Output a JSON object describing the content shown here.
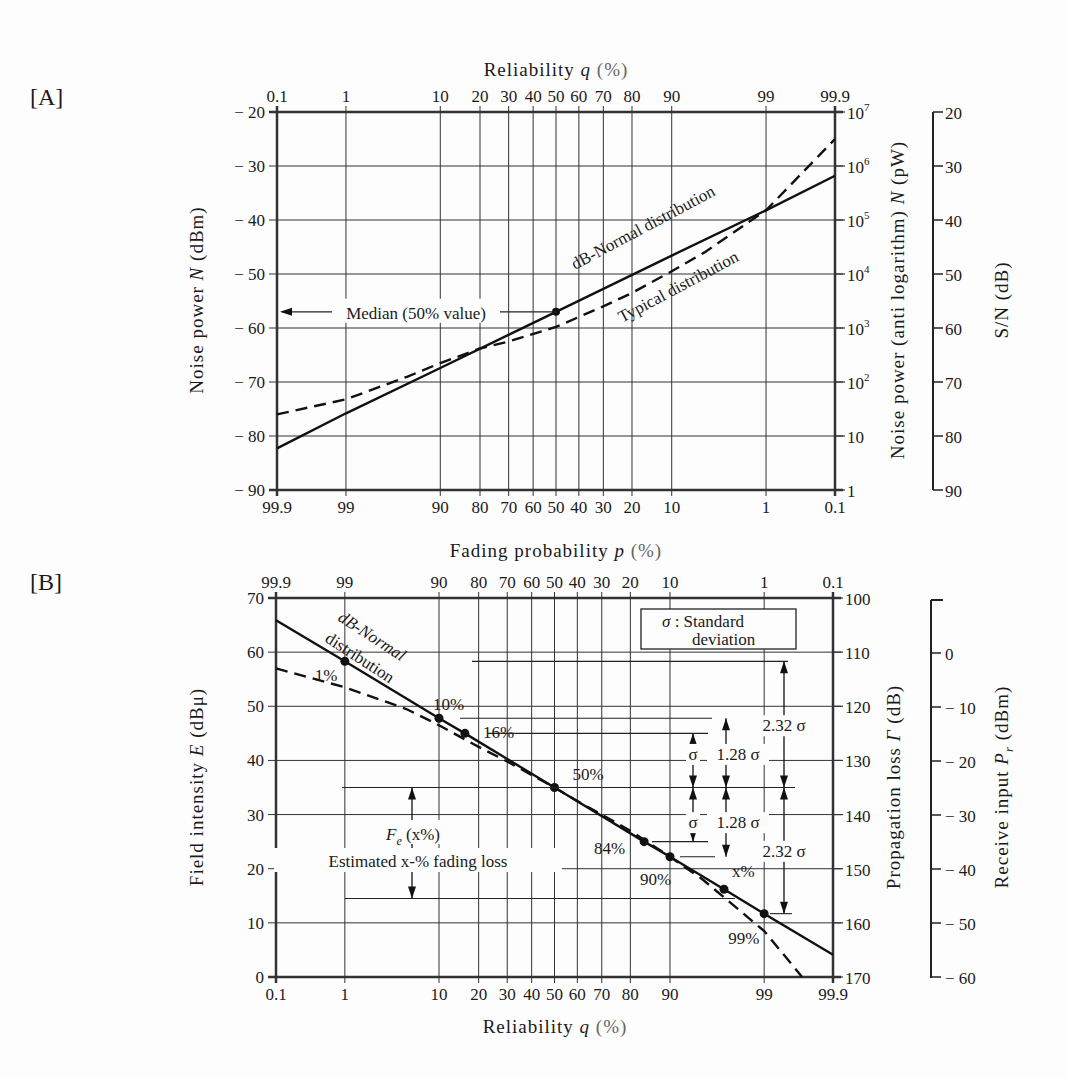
{
  "chart_data": [
    {
      "panel": "[A]",
      "type": "line",
      "title": "",
      "x_scale": "normal-probability",
      "xlabel_top": "Reliability q (%)",
      "xlabel_bottom": "",
      "x_ticks_top": [
        "0.1",
        "1",
        "10",
        "20",
        "30",
        "40",
        "50",
        "60",
        "70",
        "80",
        "90",
        "99",
        "99.9"
      ],
      "x_ticks_bottom": [
        "99.9",
        "99",
        "90",
        "80",
        "70",
        "60",
        "50",
        "40",
        "30",
        "20",
        "10",
        "1",
        "0.1"
      ],
      "ylabel": "Noise power N (dBm)",
      "ylim": [
        -90,
        -20
      ],
      "y_ticks": [
        "-20",
        "-30",
        "-40",
        "-50",
        "-60",
        "-70",
        "-80",
        "-90"
      ],
      "y2label": "Noise power (anti logarithm) N (pW)",
      "y2_ticks": [
        "10^7",
        "10^6",
        "10^5",
        "10^4",
        "10^3",
        "10^2",
        "10",
        "1"
      ],
      "y3label": "S/N (dB)",
      "y3_ticks": [
        "20",
        "30",
        "40",
        "50",
        "60",
        "70",
        "80",
        "90"
      ],
      "grid": true,
      "series": [
        {
          "name": "dB-Normal distribution",
          "style": "solid",
          "x": [
            0.1,
            1,
            10,
            50,
            90,
            99,
            99.9
          ],
          "y": [
            -82.3,
            -75.8,
            -67.4,
            -57.0,
            -46.6,
            -38.2,
            -31.8
          ]
        },
        {
          "name": "Typical distribution",
          "style": "dashed",
          "x": [
            0.1,
            1,
            5,
            10,
            20,
            30,
            50,
            70,
            80,
            90,
            95,
            99,
            99.9
          ],
          "y": [
            -76.0,
            -73.2,
            -69.0,
            -66.5,
            -63.8,
            -62.5,
            -59.8,
            -56.0,
            -53.5,
            -49.5,
            -46.0,
            -38.2,
            -25.0
          ]
        }
      ],
      "annotations": [
        {
          "text": "Median (50% value)",
          "x": 50,
          "y": -57
        },
        {
          "text": "dB-Normal distribution"
        },
        {
          "text": "Typical distribution"
        }
      ]
    },
    {
      "panel": "[B]",
      "type": "line",
      "title": "",
      "x_scale": "normal-probability",
      "xlabel_top": "Fading probability p (%)",
      "xlabel_bottom": "Reliability q (%)",
      "x_ticks_top": [
        "99.9",
        "99",
        "90",
        "80",
        "70",
        "60",
        "50",
        "40",
        "30",
        "20",
        "10",
        "1",
        "0.1"
      ],
      "x_ticks_bottom": [
        "0.1",
        "1",
        "10",
        "20",
        "30",
        "40",
        "50",
        "60",
        "70",
        "80",
        "90",
        "99",
        "99.9"
      ],
      "ylabel": "Field intensity E (dBμ)",
      "ylim": [
        0,
        70
      ],
      "y_ticks": [
        "70",
        "60",
        "50",
        "40",
        "30",
        "20",
        "10",
        "0"
      ],
      "y2label": "Propagation loss Γ (dB)",
      "y2_ticks": [
        "100",
        "110",
        "120",
        "130",
        "140",
        "150",
        "160",
        "170"
      ],
      "y3label": "Receive input Pr (dBm)",
      "y3_ticks": [
        "0",
        "-10",
        "-20",
        "-30",
        "-40",
        "-50",
        "-60"
      ],
      "grid": true,
      "series": [
        {
          "name": "dB-Normal distribution",
          "style": "solid",
          "x": [
            0.1,
            1,
            10,
            16,
            50,
            84,
            90,
            97,
            99,
            99.9
          ],
          "y": [
            65.9,
            58.3,
            47.8,
            45.0,
            35.0,
            25.0,
            22.2,
            16.2,
            11.7,
            4.1
          ]
        },
        {
          "name": "Typical distribution",
          "style": "dashed",
          "x": [
            0.1,
            1,
            5,
            10,
            20,
            30,
            50,
            60,
            70,
            80,
            90,
            95,
            99,
            99.7
          ],
          "y": [
            57.0,
            53.5,
            49.5,
            46.5,
            42.5,
            39.8,
            35.0,
            32.5,
            30.0,
            27.0,
            22.2,
            18.0,
            8.5,
            0.0
          ]
        }
      ],
      "markers": [
        {
          "label": "1%",
          "x": 1,
          "y": 58.3
        },
        {
          "label": "10%",
          "x": 10,
          "y": 47.8
        },
        {
          "label": "16%",
          "x": 16,
          "y": 45.0
        },
        {
          "label": "50%",
          "x": 50,
          "y": 35.0
        },
        {
          "label": "84%",
          "x": 84,
          "y": 25.0
        },
        {
          "label": "90%",
          "x": 90,
          "y": 22.2
        },
        {
          "label": "x%",
          "x": 97,
          "y": 16.2
        },
        {
          "label": "99%",
          "x": 99,
          "y": 11.7
        }
      ],
      "annotations": [
        {
          "text": "σ : Standard deviation"
        },
        {
          "text": "σ"
        },
        {
          "text": "1.28 σ"
        },
        {
          "text": "2.32 σ"
        },
        {
          "text": "Fe (x%)"
        },
        {
          "text": "Estimated x-% fading loss"
        }
      ]
    }
  ],
  "labels": {
    "panel_a": "[A]",
    "panel_b": "[B]",
    "a_top_axis": "Reliability",
    "a_top_var": "q",
    "a_left_axis": "Noise power",
    "a_left_var": "N",
    "a_left_unit": "(dBm)",
    "a_right_axis": "Noise power (anti logarithm)",
    "a_right_var": "N",
    "a_right_unit": "(pW)",
    "a_sn_axis": "S/N (dB)",
    "a_mid_axis": "Fading probability",
    "a_mid_var": "p",
    "pct_unit": "(%)",
    "median_label": "Median (50% value)",
    "normal_label": "dB-Normal distribution",
    "typical_label": "Typical distribution",
    "b_left_axis": "Field intensity",
    "b_left_var": "E",
    "b_left_unit": "(dBμ)",
    "b_right_axis": "Propagation loss",
    "b_right_var": "Γ",
    "b_right_unit": "(dB)",
    "b_pr_axis": "Receive input",
    "b_pr_var": "P",
    "b_pr_sub": "r",
    "b_pr_unit": "(dBm)",
    "b_bottom_axis": "Reliability",
    "b_bottom_var": "q",
    "b_normal_1": "dB-Normal",
    "b_normal_2": "distribution",
    "sigma_box_1": "σ : Standard",
    "sigma_box_2": "deviation",
    "sigma": "σ",
    "k128": "1.28 σ",
    "k232": "2.32 σ",
    "fe_label": "F",
    "fe_sub": "e",
    "fe_arg": "(x%)",
    "fe_desc": "Estimated x-% fading loss"
  }
}
